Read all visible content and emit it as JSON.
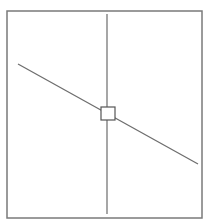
{
  "diagram": {
    "type": "geometric-line-diagram",
    "frame": {
      "x": 7,
      "y": 11,
      "width": 195,
      "height": 207,
      "stroke": "#7a7a7a",
      "stroke_width": 1.5
    },
    "vertical_line": {
      "x1": 107,
      "y1": 14,
      "x2": 107,
      "y2": 214,
      "stroke": "#777777",
      "stroke_width": 1.3
    },
    "diagonal_line": {
      "x1": 18,
      "y1": 64,
      "x2": 198,
      "y2": 164,
      "stroke": "#6e6e6e",
      "stroke_width": 1.3
    },
    "center_marker": {
      "x": 101,
      "y": 107,
      "width": 14,
      "height": 13,
      "fill": "#ffffff",
      "stroke": "#555555",
      "stroke_width": 1.2
    }
  }
}
